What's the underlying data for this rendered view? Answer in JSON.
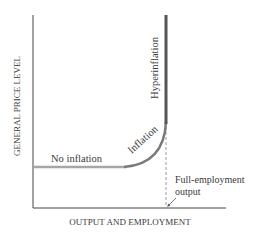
{
  "diagram": {
    "title": "",
    "axes": {
      "y_label": "GENERAL PRICE LEVEL",
      "x_label": "OUTPUT AND EMPLOYMENT"
    },
    "segments": [
      {
        "name": "no-inflation",
        "label": "No inflation",
        "color": "#a6a6a6"
      },
      {
        "name": "inflation",
        "label": "Inflation",
        "color": "#7a7a7a"
      },
      {
        "name": "hyperinflation",
        "label": "Hyperinflation",
        "color": "#555555"
      }
    ],
    "annotation": {
      "line1": "Full-employment",
      "line2": "output"
    },
    "colors": {
      "axis": "#444444",
      "text": "#3a3a3a",
      "dashed_line": "#9a9a9a"
    }
  }
}
